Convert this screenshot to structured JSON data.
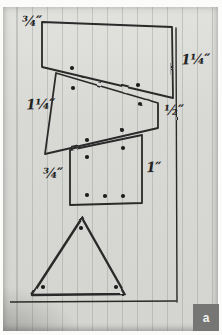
{
  "figure": {
    "badge_label": "a",
    "colors": {
      "ink": "#2a2a2a",
      "dot": "#1c1c1c",
      "paper": "#d8d9d5",
      "rule_line": "#b9beb8",
      "badge_bg": "#767674",
      "badge_text": "#f2f2f0"
    },
    "dimension_labels": [
      {
        "name": "top-left",
        "text": "¾″",
        "x": 22,
        "y": 14
      },
      {
        "name": "right-top",
        "text": "1¼″",
        "x": 181,
        "y": 52
      },
      {
        "name": "mid-left",
        "text": "1¼″",
        "x": 26,
        "y": 97
      },
      {
        "name": "mid-right",
        "text": "½″",
        "x": 164,
        "y": 103
      },
      {
        "name": "bottom-left",
        "text": "¾″",
        "x": 43,
        "y": 166
      },
      {
        "name": "bottom-right",
        "text": "1″",
        "x": 146,
        "y": 160
      }
    ],
    "shapes": [
      {
        "name": "top-strip",
        "points": "42,22 172,27 173,98 42,67",
        "stroke_width": 1.8
      },
      {
        "name": "middle-strip",
        "points": "56,73 158,103 158,128 45,154",
        "stroke_width": 1.8
      },
      {
        "name": "bottom-strip",
        "points": "70,150 142,135 142,203 70,205",
        "stroke_width": 1.8
      },
      {
        "name": "triangle",
        "points": "82,218 32,295 125,294",
        "stroke_width": 2.4
      }
    ],
    "guide_lines": [
      {
        "name": "right-border-line",
        "x1": 176,
        "y1": 28,
        "x2": 177,
        "y2": 302
      },
      {
        "name": "bottom-border-line",
        "x1": 10,
        "y1": 302,
        "x2": 176,
        "y2": 301
      }
    ],
    "dots": [
      [
        72,
        68
      ],
      [
        138,
        85
      ],
      [
        73,
        88
      ],
      [
        140,
        104
      ],
      [
        87,
        140
      ],
      [
        122,
        130
      ],
      [
        87,
        157
      ],
      [
        123,
        148
      ],
      [
        87,
        195
      ],
      [
        105,
        196
      ],
      [
        123,
        196
      ],
      [
        81,
        228
      ],
      [
        43,
        287
      ],
      [
        116,
        287
      ]
    ]
  }
}
